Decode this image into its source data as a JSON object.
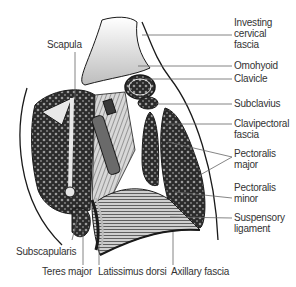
{
  "figure": {
    "colors": {
      "ink": "#1a1a1a",
      "muscle_fill": "#2b2b2b",
      "bone": "#e8e8e8",
      "leader": "#666666",
      "text": "#333333"
    }
  },
  "labels": {
    "investing_cervical_fascia": "Investing\ncervical\nfascia",
    "omohyoid": "Omohyoid",
    "clavicle": "Clavicle",
    "subclavius": "Subclavius",
    "clavipectoral_fascia": "Clavipectoral\nfascia",
    "pectoralis_major": "Pectoralis\nmajor",
    "pectoralis_minor": "Pectoralis\nminor",
    "suspensory_ligament": "Suspensory\nligament",
    "scapula": "Scapula",
    "subscapularis": "Subscapularis",
    "teres_major": "Teres major",
    "latissimus_dorsi": "Latissimus dorsi",
    "axillary_fascia": "Axillary fascia"
  }
}
